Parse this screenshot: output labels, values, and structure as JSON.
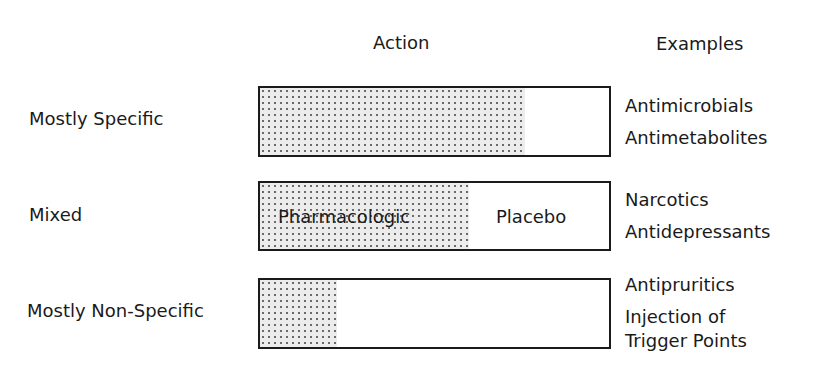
{
  "headers": {
    "action": "Action",
    "examples": "Examples"
  },
  "rows": [
    {
      "label": "Mostly Specific",
      "specific_fraction": 0.76,
      "inner_labels": [],
      "examples": [
        "Antimicrobials",
        "Antimetabolites"
      ]
    },
    {
      "label": "Mixed",
      "specific_fraction": 0.6,
      "inner_labels": [
        "Pharmacologic",
        "Placebo"
      ],
      "examples": [
        "Narcotics",
        "Antidepressants"
      ]
    },
    {
      "label": "Mostly Non-Specific",
      "specific_fraction": 0.22,
      "inner_labels": [],
      "examples": [
        "Antipruritics",
        "Injection of",
        "Trigger Points"
      ]
    }
  ],
  "colors": {
    "ink": "#1a1a1a",
    "stipple": "#6a6a6a",
    "background": "#ffffff"
  }
}
